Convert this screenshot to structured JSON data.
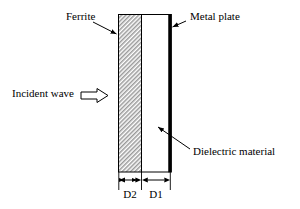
{
  "figure": {
    "type": "cross-section-diagram",
    "background_color": "#ffffff",
    "line_color": "#000000"
  },
  "labels": {
    "ferrite": "Ferrite",
    "metal_plate": "Metal plate",
    "incident_wave": "Incident wave",
    "dielectric_material": "Dielectric material",
    "dim_d2": "D2",
    "dim_d1": "D1"
  },
  "layers": [
    {
      "name": "ferrite",
      "label": "Ferrite",
      "fill": "hatched",
      "fill_color": "#d8d8d8",
      "thickness_label": "D2"
    },
    {
      "name": "dielectric-material",
      "label": "Dielectric material",
      "fill": "white",
      "fill_color": "#ffffff",
      "thickness_label": "D1"
    },
    {
      "name": "metal-plate",
      "label": "Metal plate",
      "fill": "solid",
      "fill_color": "#000000",
      "thickness_label": ""
    }
  ],
  "annotations": {
    "incident_wave_direction": "left-to-right",
    "incident_wave_arrow": "hollow-block-arrow-right"
  },
  "icons": {
    "leader_arrow": "leader-arrow-icon",
    "block_arrow": "block-arrow-right-icon",
    "dimension_arrow": "dimension-arrow-icon"
  }
}
